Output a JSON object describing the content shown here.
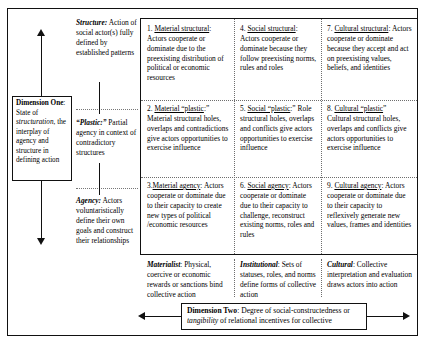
{
  "figure": {
    "dimension_one": {
      "lead": "Dimension One",
      "body": ": State of structuration, the interplay of agency and structure in defining action",
      "italic_term": "structuration"
    },
    "dimension_two": {
      "lead": "Dimension Two",
      "body": ": Degree of social-constructedness or tangibility of relational incentives for collective",
      "italic_term": "tangibility"
    },
    "row_labels": [
      {
        "id": "structure",
        "lead": "Structure:",
        "text": " Action of social actor(s) fully defined by established patterns"
      },
      {
        "id": "plastic",
        "lead": "“Plastic:”",
        "text": " Partial agency in context of contradictory structures"
      },
      {
        "id": "agency",
        "lead": "Agency:",
        "text": " Actors voluntaristically define their own goals and construct their relationships"
      }
    ],
    "column_labels": [
      {
        "id": "materialist",
        "lead": "Materialist",
        "text": ": Physical, coercive or economic rewards or sanctions bind collective action"
      },
      {
        "id": "institutional",
        "lead": "Institutional",
        "text": ": Sets of statuses, roles, and norms define forms of collective action"
      },
      {
        "id": "cultural",
        "lead": "Cultural",
        "text": ": Collective interpretation and evaluation draws actors into action"
      }
    ],
    "cells": [
      {
        "number": "1.",
        "heading": "Material structural",
        "tail": ":",
        "body": "Actors cooperate or dominate due to the preexisting distribution of political or economic resources"
      },
      {
        "number": "4.",
        "heading": "Social structural",
        "tail": ":",
        "body": "Actors cooperate or dominate because they follow preexisting norms, rules and roles"
      },
      {
        "number": "7.",
        "heading": "Cultural structural",
        "tail": ":",
        "body": "Actors cooperate or dominate because they accept and act on preexisting values, beliefs, and identities"
      },
      {
        "number": "2.",
        "heading": "Material “plastic",
        "tail": ":”",
        "body": "Material structural holes, overlaps and contradictions give actors opportunities to exercise influence"
      },
      {
        "number": "5.",
        "heading": "Social “plastic",
        "tail": ":”",
        "body": "Role structural holes, overlaps and conflicts give actors opportunities to exercise influence"
      },
      {
        "number": "8.",
        "heading": "Cultural “plastic",
        "tail": "”",
        "body": "Cultural structural holes, overlaps and conflicts give actors opportunities to exercise influence"
      },
      {
        "number": "3.",
        "heading": "Material agency",
        "tail": ":",
        "body": "Actors cooperate or dominate due to their capacity to create new types of political /economic resources"
      },
      {
        "number": "6.",
        "heading": "Social agency",
        "tail": ":",
        "body": "Actors cooperate or dominate due to their capacity to challenge, reconstruct existing norms, roles and rules"
      },
      {
        "number": "9.",
        "heading": "Cultural agency",
        "tail": ":",
        "body": "Actors cooperate or dominate due to their capacity to reflexively generate new values, frames and identities"
      }
    ],
    "colors": {
      "ink": "#111111",
      "dotted": "#6e6e6e",
      "background": "#ffffff"
    }
  }
}
